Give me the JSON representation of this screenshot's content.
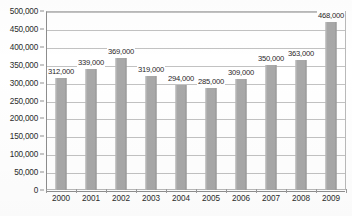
{
  "chart_data": {
    "type": "bar",
    "title": "",
    "xlabel": "",
    "ylabel": "",
    "categories": [
      "2000",
      "2001",
      "2002",
      "2003",
      "2004",
      "2005",
      "2006",
      "2007",
      "2008",
      "2009"
    ],
    "values": [
      312000,
      339000,
      369000,
      319000,
      294000,
      285000,
      309000,
      350000,
      363000,
      468000
    ],
    "data_labels": [
      "312,000",
      "339,000",
      "369,000",
      "319,000",
      "294,000",
      "285,000",
      "309,000",
      "350,000",
      "363,000",
      "468,000"
    ],
    "ylim": [
      0,
      500000
    ],
    "ytick_values": [
      0,
      50000,
      100000,
      150000,
      200000,
      250000,
      300000,
      350000,
      400000,
      450000,
      500000
    ],
    "ytick_labels": [
      "0",
      "50,000",
      "100,000",
      "150,000",
      "200,000",
      "250,000",
      "300,000",
      "350,000",
      "400,000",
      "450,000",
      "500,000"
    ],
    "grid": true,
    "legend": false,
    "legend_position": "none",
    "series_name": "",
    "bar_color": "#a8a8a8",
    "gridline_color": "#c2c2c2",
    "axis_color": "#8f8f8f",
    "text_color": "#2b2b2b",
    "background_color": "#ffffff"
  }
}
